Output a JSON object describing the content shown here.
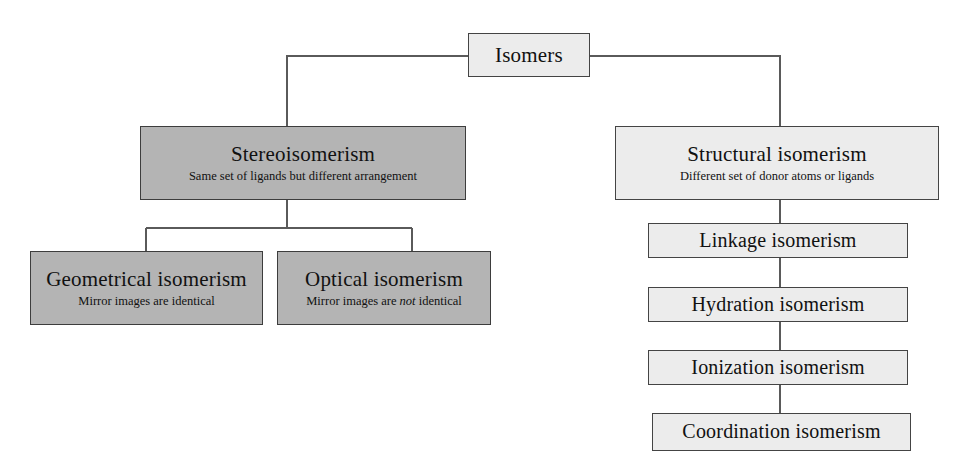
{
  "diagram": {
    "colors": {
      "shade_dark": "#b4b4b4",
      "shade_light": "#ececec",
      "border": "#444444",
      "connector": "#5a5a5a",
      "background": "#ffffff",
      "text": "#111111"
    }
  },
  "nodes": {
    "isomers": {
      "title": "Isomers",
      "subtitle": ""
    },
    "stereoisomerism": {
      "title": "Stereoisomerism",
      "subtitle": "Same set of ligands but different arrangement"
    },
    "structural_isomerism": {
      "title": "Structural isomerism",
      "subtitle": "Different set of donor atoms or ligands"
    },
    "geometrical_isomerism": {
      "title": "Geometrical isomerism",
      "subtitle": "Mirror images are identical"
    },
    "optical_isomerism": {
      "title": "Optical isomerism",
      "subtitle_prefix": "Mirror images are ",
      "subtitle_emphasis": "not",
      "subtitle_suffix": " identical"
    },
    "linkage_isomerism": {
      "title": "Linkage isomerism"
    },
    "hydration_isomerism": {
      "title": "Hydration isomerism"
    },
    "ionization_isomerism": {
      "title": "Ionization isomerism"
    },
    "coordination_isomerism": {
      "title": "Coordination isomerism"
    }
  },
  "edges": [
    {
      "name": "isomers-to-stereoisomerism",
      "from": "isomers",
      "to": "stereoisomerism"
    },
    {
      "name": "isomers-to-structural-isomerism",
      "from": "isomers",
      "to": "structural_isomerism"
    },
    {
      "name": "stereoisomerism-to-geometrical-isomerism",
      "from": "stereoisomerism",
      "to": "geometrical_isomerism"
    },
    {
      "name": "stereoisomerism-to-optical-isomerism",
      "from": "stereoisomerism",
      "to": "optical_isomerism"
    },
    {
      "name": "structural-isomerism-to-linkage-isomerism",
      "from": "structural_isomerism",
      "to": "linkage_isomerism"
    },
    {
      "name": "linkage-isomerism-to-hydration-isomerism",
      "from": "linkage_isomerism",
      "to": "hydration_isomerism"
    },
    {
      "name": "hydration-isomerism-to-ionization-isomerism",
      "from": "hydration_isomerism",
      "to": "ionization_isomerism"
    },
    {
      "name": "ionization-isomerism-to-coordination-isomerism",
      "from": "ionization_isomerism",
      "to": "coordination_isomerism"
    }
  ]
}
